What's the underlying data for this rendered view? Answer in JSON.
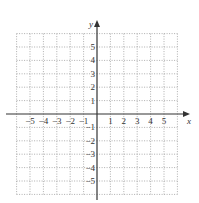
{
  "chart_data": {
    "type": "scatter",
    "title": "",
    "xlabel": "x",
    "ylabel": "y",
    "xlim": [
      -6,
      6
    ],
    "ylim": [
      -6,
      6
    ],
    "grid": true,
    "grid_style": "dotted",
    "x_ticks": [
      -5,
      -4,
      -3,
      -2,
      -1,
      1,
      2,
      3,
      4,
      5
    ],
    "y_ticks": [
      5,
      4,
      3,
      2,
      1,
      -1,
      -2,
      -3,
      -4,
      -5
    ],
    "x_tick_labels": [
      "−5",
      "−4",
      "−3",
      "−2",
      "−1",
      "1",
      "2",
      "3",
      "4",
      "5"
    ],
    "y_tick_labels": [
      "5",
      "4",
      "3",
      "2",
      "1",
      "−1",
      "−2",
      "−3",
      "−4",
      "−5"
    ],
    "series": []
  },
  "colors": {
    "axis": "#333333",
    "grid": "#9a9a9a",
    "background": "#ffffff"
  }
}
